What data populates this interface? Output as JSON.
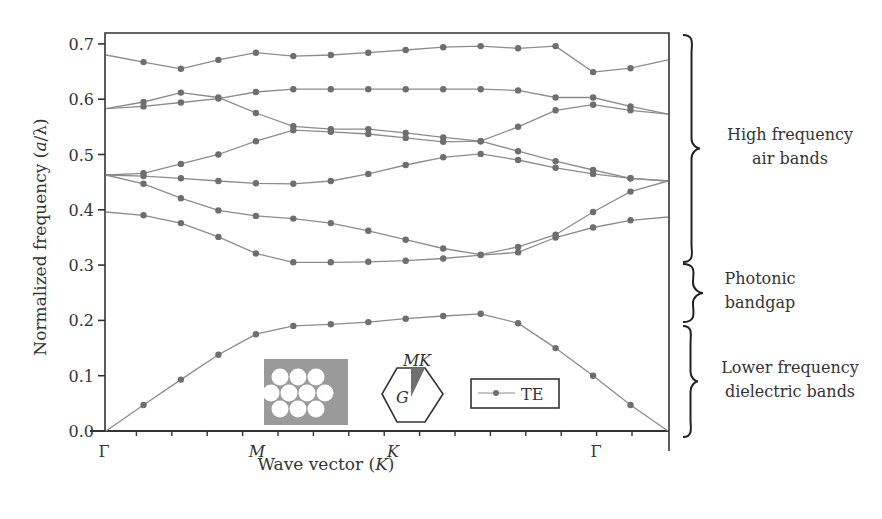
{
  "chart_data": {
    "type": "line",
    "title": "",
    "xlabel": "Wave vector (K)",
    "xlabel_parts": {
      "prefix": "Wave vector (",
      "italic": "K",
      "suffix": ")"
    },
    "ylabel": "Normalized frequency (a/λ)",
    "ylabel_parts": {
      "prefix": "Normalized frequency (",
      "italic": "a",
      "suffix": "/λ)"
    },
    "ylim": [
      0.0,
      0.72
    ],
    "yticks": [
      0.0,
      0.1,
      0.2,
      0.3,
      0.4,
      0.5,
      0.6,
      0.7
    ],
    "ytick_labels": [
      "0.0",
      "0.1",
      "0.2",
      "0.3",
      "0.4",
      "0.5",
      "0.6",
      "0.7"
    ],
    "x_symmetry_labels": [
      {
        "label": "Γ",
        "index": 0,
        "italic": false
      },
      {
        "label": "M",
        "index": 4.6,
        "italic": true
      },
      {
        "label": "K",
        "index": 8.3,
        "italic": true
      },
      {
        "label": "Γ",
        "index": 13.8,
        "italic": false
      }
    ],
    "x_points": 16,
    "x_minor_ticks": 17,
    "grid": false,
    "legend": {
      "entries": [
        "TE"
      ],
      "position": "lower center inset"
    },
    "series": [
      {
        "name": "TE band 1",
        "values": [
          0.68,
          0.667,
          0.655,
          0.671,
          0.684,
          0.678,
          0.68,
          0.684,
          0.689,
          0.694,
          0.696,
          0.692,
          0.696,
          0.649,
          0.656,
          0.671
        ]
      },
      {
        "name": "TE band 2",
        "values": [
          0.583,
          0.595,
          0.612,
          0.603,
          0.575,
          0.551,
          0.546,
          0.546,
          0.539,
          0.531,
          0.524,
          0.55,
          0.58,
          0.59,
          0.58,
          0.573
        ]
      },
      {
        "name": "TE band 3",
        "values": [
          0.583,
          0.587,
          0.594,
          0.601,
          0.613,
          0.618,
          0.618,
          0.618,
          0.618,
          0.618,
          0.618,
          0.616,
          0.603,
          0.603,
          0.587,
          0.573
        ]
      },
      {
        "name": "TE band 4",
        "values": [
          0.463,
          0.466,
          0.483,
          0.5,
          0.524,
          0.544,
          0.541,
          0.537,
          0.53,
          0.523,
          0.524,
          0.506,
          0.488,
          0.472,
          0.457,
          0.452
        ]
      },
      {
        "name": "TE band 5",
        "values": [
          0.463,
          0.461,
          0.457,
          0.452,
          0.448,
          0.447,
          0.452,
          0.465,
          0.481,
          0.495,
          0.501,
          0.49,
          0.476,
          0.465,
          0.457,
          0.452
        ]
      },
      {
        "name": "TE band 6",
        "values": [
          0.463,
          0.447,
          0.421,
          0.399,
          0.389,
          0.384,
          0.376,
          0.362,
          0.346,
          0.33,
          0.319,
          0.333,
          0.355,
          0.396,
          0.433,
          0.452
        ]
      },
      {
        "name": "TE band 7",
        "values": [
          0.396,
          0.39,
          0.376,
          0.351,
          0.321,
          0.305,
          0.305,
          0.306,
          0.308,
          0.312,
          0.318,
          0.323,
          0.35,
          0.368,
          0.381,
          0.387
        ]
      },
      {
        "name": "TE band 8",
        "values": [
          0.0,
          0.047,
          0.093,
          0.138,
          0.175,
          0.19,
          0.193,
          0.197,
          0.203,
          0.208,
          0.212,
          0.195,
          0.15,
          0.1,
          0.047,
          0.0
        ]
      }
    ],
    "annotations": [
      {
        "text_lines": [
          "High frequency",
          "air bands"
        ],
        "range": [
          0.41,
          0.71
        ]
      },
      {
        "text_lines": [
          "Photonic",
          "bandgap"
        ],
        "range": [
          0.31,
          0.41
        ]
      },
      {
        "text_lines": [
          "Lower frequency",
          "dielectric bands"
        ],
        "range": [
          0.0,
          0.2
        ]
      }
    ],
    "insets": {
      "lattice": "triangular lattice of air holes (grey dielectric)",
      "brillouin_zone": {
        "labels": [
          "M",
          "K",
          "G"
        ]
      }
    }
  },
  "colors": {
    "line": "#8c8c8c",
    "marker": "#6e6e6e",
    "axis": "#333333",
    "inset_fill": "#9a9a9a",
    "wedge_fill": "#707070"
  }
}
